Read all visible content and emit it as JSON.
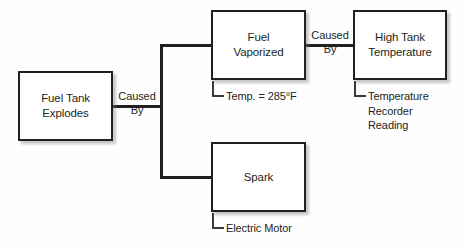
{
  "diagram": {
    "type": "cause-and-effect-tree",
    "background_color": "#fefefe",
    "line_color": "#231f20",
    "nodes": [
      {
        "id": "fuel-tank-explodes",
        "label": "Fuel Tank\nExplodes"
      },
      {
        "id": "fuel-vaporized",
        "label": "Fuel\nVaporized"
      },
      {
        "id": "spark",
        "label": "Spark"
      },
      {
        "id": "high-tank-temperature",
        "label": "High Tank\nTemperature"
      }
    ],
    "connector_labels": [
      {
        "id": "caused-by-left",
        "above": "Caused",
        "below": "By"
      },
      {
        "id": "caused-by-right",
        "above": "Caused",
        "below": "By"
      }
    ],
    "annotations": [
      {
        "id": "temp-reading",
        "text": "Temp. = 285°F"
      },
      {
        "id": "temperature-recorder-reading",
        "text": "Temperature\n  Recorder\n  Reading"
      },
      {
        "id": "electric-motor",
        "text": "Electric Motor"
      }
    ]
  }
}
